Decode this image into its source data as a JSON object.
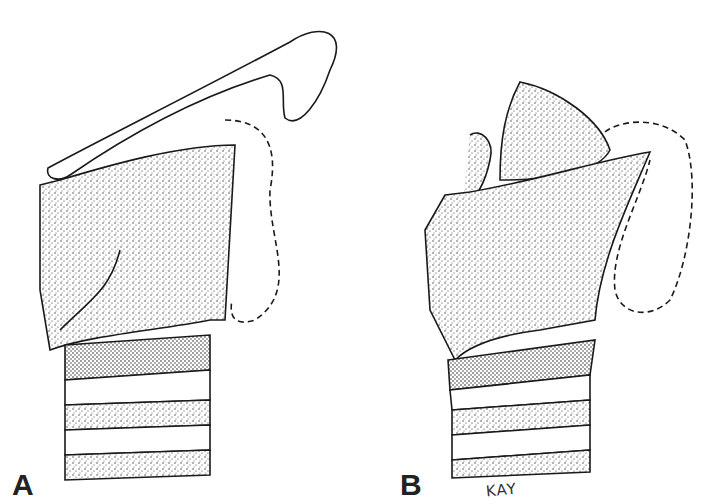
{
  "figure": {
    "panels": [
      {
        "label": "A",
        "description": "Larynx lateral view with hyoid bone raised, thyroid cartilage stippled, tracheal rings below, dashed outline of soft tissue"
      },
      {
        "label": "B",
        "description": "Larynx lateral view with epiglottis/thyroid tilted, stippled cartilages, tracheal rings below, dashed outline"
      }
    ],
    "signature": "KAY",
    "colors": {
      "ink": "#1a1a1a",
      "background": "#ffffff",
      "stipple": "#3a3a3a"
    }
  }
}
